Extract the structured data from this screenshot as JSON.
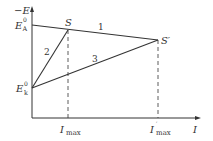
{
  "diagram": {
    "axes": {
      "y_label": "−E",
      "x_label": "I"
    },
    "y_ticks": [
      {
        "id": "EA0",
        "base": "E",
        "sup": "0",
        "sub": "A"
      },
      {
        "id": "Ek0",
        "base": "E",
        "sup": "0",
        "sub": "k"
      }
    ],
    "x_ticks": [
      {
        "id": "Imax",
        "base": "I",
        "sub": "max",
        "sup": ""
      },
      {
        "id": "Imax_prime",
        "base": "I",
        "sub": "max",
        "sup": "′"
      }
    ],
    "points": [
      {
        "id": "S",
        "label": "S"
      },
      {
        "id": "S_prime",
        "label": "S′"
      }
    ],
    "lines": [
      {
        "id": "line-1",
        "label": "1",
        "from": "EA0",
        "to": "S_prime"
      },
      {
        "id": "line-2",
        "label": "2",
        "from": "Ek0",
        "to": "S"
      },
      {
        "id": "line-3",
        "label": "3",
        "from": "Ek0",
        "to": "S_prime"
      }
    ],
    "colors": {
      "stroke": "#333333",
      "background": "#ffffff"
    }
  }
}
